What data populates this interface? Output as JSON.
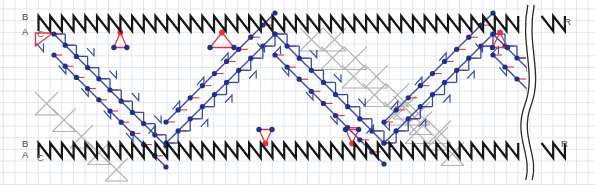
{
  "figure_title": "strip-billiard-diagram",
  "labels": {
    "b_top": "B",
    "a_top": "A",
    "c_top": "C",
    "b_bottom": "B",
    "a_bottom": "A",
    "c_bottom": "C",
    "r_top": "R",
    "r_bottom": "R"
  },
  "colors": {
    "grid": "#ccd6e4",
    "wall": "#161616",
    "path_blue": "#3a4ba6",
    "dot_blue": "#20308f",
    "accent_red": "#e8323c",
    "ghost_gray": "#b4b4b4",
    "label_gray": "#4a4a4a",
    "background": "#ffffff"
  },
  "diagram": {
    "width": 595,
    "height": 185,
    "unit": 11.7,
    "grid": {
      "x0": 3.2,
      "y0": 9.0
    },
    "walls": {
      "top": {
        "y_top": 16,
        "y_bottom": 31,
        "x_start": 38.5,
        "x_break": 525,
        "x_resume": 541.5,
        "x_end": 565
      },
      "bottom": {
        "y_top": 143,
        "y_bottom": 158,
        "x_start": 38.5,
        "x_break": 525,
        "x_resume": 541.5,
        "x_end": 565
      }
    },
    "start_triangle": [
      [
        35.5,
        33
      ],
      [
        35.5,
        46
      ],
      [
        53,
        33
      ]
    ],
    "trajectory": {
      "turning_points": [
        [
          54,
          34
        ],
        [
          166,
          143
        ],
        [
          275,
          34
        ],
        [
          384,
          143
        ],
        [
          493,
          34
        ],
        [
          529,
          71
        ]
      ],
      "band_offset": 21,
      "dot_radius": 2.6
    },
    "bounce_motifs": [
      {
        "wall": "top",
        "x": 120.4,
        "wing": 6.5
      },
      {
        "wall": "top",
        "x": 222.0,
        "wing": 12
      },
      {
        "wall": "bottom",
        "x": 265.5,
        "wing": 6.5
      },
      {
        "wall": "bottom",
        "x": 352.1,
        "wing": 6.5
      },
      {
        "wall": "top",
        "x": 500.0,
        "wing": 7.5
      }
    ],
    "ghost_clusters": [
      {
        "x": 35,
        "y": 92,
        "steps": 5,
        "dx": 17.5,
        "dy": 16.5,
        "size": 23,
        "rows": 1
      },
      {
        "x": 300,
        "y": 28,
        "steps": 6,
        "dx": 21.0,
        "dy": 18.5,
        "size": 23,
        "rows": 2,
        "row_dx": 23,
        "row_dy": 0
      },
      {
        "x": 393,
        "y": 96,
        "steps": 4,
        "dx": 16.0,
        "dy": 15.5,
        "size": 23,
        "rows": 1
      }
    ],
    "break_lines": {
      "center_x": 531,
      "half_gap": 3.2,
      "y_top": 5,
      "y_bottom": 180
    }
  }
}
